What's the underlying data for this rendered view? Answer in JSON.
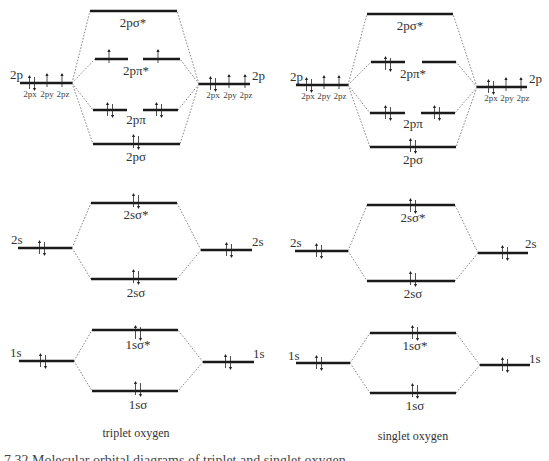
{
  "diagrams": [
    {
      "name": "triplet-oxygen",
      "caption": "triplet oxygen",
      "atomic": {
        "left": {
          "2p": "2p",
          "2s": "2s",
          "1s": "1s",
          "sub": [
            "2px",
            "2py",
            "2pz"
          ]
        },
        "right": {
          "2p": "2p",
          "2s": "2s",
          "1s": "1s",
          "sub": [
            "2px",
            "2py",
            "2pz"
          ]
        }
      },
      "molecular": {
        "2p_sigma_star": "2pσ*",
        "2p_pi_star": "2pπ*",
        "2p_pi": "2pπ",
        "2p_sigma": "2pσ",
        "2s_sigma_star": "2sσ*",
        "2s_sigma": "2sσ",
        "1s_sigma_star": "1sσ*",
        "1s_sigma": "1sσ"
      },
      "electrons": {
        "2p_pi_star": [
          "up",
          "up"
        ],
        "2p_pi": [
          "pair",
          "pair"
        ],
        "2p_sigma": [
          "pair"
        ],
        "atomic_2p": [
          "pair",
          "up",
          "up"
        ]
      }
    },
    {
      "name": "singlet-oxygen",
      "caption": "singlet oxygen",
      "atomic": {
        "left": {
          "2p": "2p",
          "2s": "2s",
          "1s": "1s",
          "sub": [
            "2px",
            "2py",
            "2pz"
          ]
        },
        "right": {
          "2p": "2p",
          "2s": "2s",
          "1s": "1s",
          "sub": [
            "2px",
            "2py",
            "2pz"
          ]
        }
      },
      "molecular": {
        "2p_sigma_star": "2pσ*",
        "2p_pi_star": "2pπ*",
        "2p_pi": "2pπ",
        "2p_sigma": "2pσ",
        "2s_sigma_star": "2sσ*",
        "2s_sigma": "2sσ",
        "1s_sigma_star": "1sσ*",
        "1s_sigma": "1sσ"
      },
      "electrons": {
        "2p_pi_star": [
          "pair",
          "empty"
        ],
        "2p_pi": [
          "pair",
          "pair"
        ],
        "2p_sigma": [
          "pair"
        ],
        "atomic_2p": [
          "pair",
          "up",
          "up"
        ]
      }
    }
  ],
  "figure_caption": "7.32  Molecular orbital diagrams of triplet and singlet oxygen"
}
